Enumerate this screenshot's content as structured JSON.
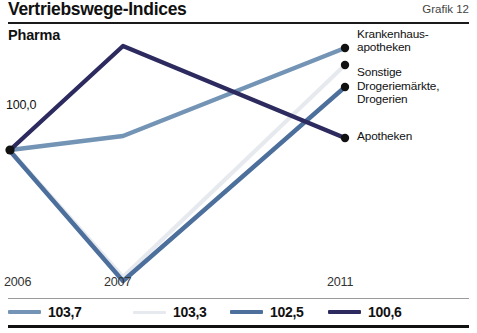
{
  "header": {
    "title": "Vertriebswege-Indices",
    "right_label": "Grafik 12"
  },
  "subtitle": "Pharma",
  "baseline_label": "100,0",
  "right_labels": [
    "Krankenhaus-\napotheken",
    "Sonstige",
    "Drogeriemärkte,\nDrogerien",
    "Apotheken"
  ],
  "x_labels": [
    "2006",
    "2007",
    "2011"
  ],
  "legend": [
    {
      "value": "103,7",
      "color": "#7394b5"
    },
    {
      "value": "103,3",
      "color": "#e6e9ee"
    },
    {
      "value": "102,5",
      "color": "#4c6f9c"
    },
    {
      "value": "100,6",
      "color": "#2c2a5e"
    }
  ],
  "chart_data": {
    "type": "line",
    "title": "Vertriebswege-Indices",
    "subtitle": "Pharma",
    "xlabel": "",
    "ylabel": "",
    "grid": false,
    "legend_position": "bottom",
    "x": [
      "2006",
      "2007",
      "2011"
    ],
    "x_pixels": [
      10,
      123,
      345
    ],
    "baseline": 100.0,
    "annotations": [
      "100,0"
    ],
    "series": [
      {
        "name": "Krankenhausapotheken",
        "final_value": 103.7,
        "color": "#7394b5",
        "values": [
          100.0,
          100.6,
          103.7
        ],
        "y_pixels": [
          150,
          136,
          48
        ]
      },
      {
        "name": "Sonstige",
        "final_value": 103.3,
        "color": "#e6e9ee",
        "values": [
          100.0,
          91.0,
          103.3
        ],
        "y_pixels": [
          150,
          277,
          65
        ]
      },
      {
        "name": "Drogeriemärkte, Drogerien",
        "final_value": 102.5,
        "color": "#4c6f9c",
        "values": [
          100.0,
          90.6,
          102.5
        ],
        "y_pixels": [
          151,
          281,
          87
        ]
      },
      {
        "name": "Apotheken",
        "final_value": 100.6,
        "color": "#2c2a5e",
        "values": [
          100.0,
          107.4,
          100.6
        ],
        "y_pixels": [
          150,
          46,
          138
        ]
      }
    ]
  }
}
